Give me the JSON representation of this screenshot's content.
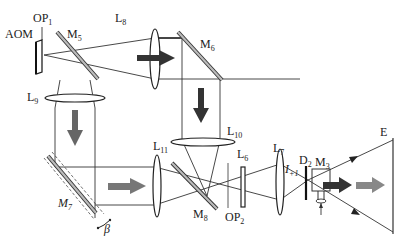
{
  "diagram": {
    "type": "optical-setup",
    "labels": {
      "aom": "AOM",
      "op1": "OP",
      "op1_sub": "1",
      "m5": "M",
      "m5_sub": "5",
      "l8": "L",
      "l8_sub": "8",
      "m6": "M",
      "m6_sub": "6",
      "l9": "L",
      "l9_sub": "9",
      "l10": "L",
      "l10_sub": "10",
      "l11": "L",
      "l11_sub": "11",
      "m7": "M",
      "m7_sub": "7",
      "m8": "M",
      "m8_sub": "8",
      "beta": "β",
      "l6": "L",
      "l6_sub": "6",
      "op2": "OP",
      "op2_sub": "2",
      "l7": "L",
      "l7_sub": "7",
      "i1": "I",
      "i1_sub": "+1",
      "d2": "D",
      "d2_sub": "2",
      "m3": "M",
      "m3_sub": "3",
      "e": "E"
    },
    "components": [
      {
        "id": "AOM",
        "kind": "acousto-optic modulator"
      },
      {
        "id": "OP1",
        "kind": "optical plane"
      },
      {
        "id": "M5",
        "kind": "mirror"
      },
      {
        "id": "L8",
        "kind": "lens"
      },
      {
        "id": "M6",
        "kind": "mirror"
      },
      {
        "id": "L9",
        "kind": "lens"
      },
      {
        "id": "L10",
        "kind": "lens"
      },
      {
        "id": "M7",
        "kind": "mirror (rotatable, angle β)"
      },
      {
        "id": "L11",
        "kind": "lens"
      },
      {
        "id": "M8",
        "kind": "mirror"
      },
      {
        "id": "OP2",
        "kind": "optical plane"
      },
      {
        "id": "L6",
        "kind": "plate"
      },
      {
        "id": "L7",
        "kind": "lens"
      },
      {
        "id": "D2",
        "kind": "diaphragm"
      },
      {
        "id": "M3",
        "kind": "rotating mirror"
      },
      {
        "id": "E",
        "kind": "screen"
      }
    ],
    "colors": {
      "line": "#333333",
      "arrow_dark": "#333333",
      "arrow_gray": "#777777",
      "mirror_fill": "#bbbbbb"
    }
  }
}
